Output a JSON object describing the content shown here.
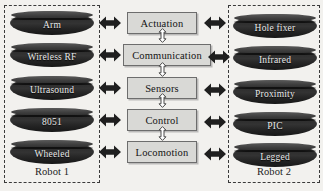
{
  "diagram": {
    "background_color": "#f2f1ee",
    "groups": [
      {
        "id": "robot1",
        "label": "Robot 1",
        "side": "left",
        "node_style": "dark-3d-cylinder",
        "node_fill": "#2b2b2b",
        "node_text_color": "#e9e9e9",
        "frame": "dashed",
        "nodes": [
          {
            "label": "Arm"
          },
          {
            "label": "Wireless RF"
          },
          {
            "label": "Ultrasound"
          },
          {
            "label": "8051"
          },
          {
            "label": "Wheeled"
          }
        ]
      },
      {
        "id": "robot2",
        "label": "Robot 2",
        "side": "right",
        "node_style": "dark-3d-cylinder",
        "node_fill": "#2b2b2b",
        "node_text_color": "#e9e9e9",
        "frame": "dashed",
        "nodes": [
          {
            "label": "Hole fixer"
          },
          {
            "label": "Infrared"
          },
          {
            "label": "Proximity"
          },
          {
            "label": "PIC"
          },
          {
            "label": "Legged"
          }
        ]
      }
    ],
    "center_column": {
      "block_fill": "#d9d9d6",
      "block_border": "#6d6d6d",
      "block_text_color": "#141414",
      "blocks": [
        {
          "label": "Actuation"
        },
        {
          "label": "Communication"
        },
        {
          "label": "Sensors"
        },
        {
          "label": "Control"
        },
        {
          "label": "Locomotion"
        }
      ]
    },
    "connectors": {
      "horizontal": {
        "style": "solid-double-headed-arrow",
        "color": "#1f1f1f",
        "count": 10,
        "note": "each Robot 1 node links to its center block; each center block links to its Robot 2 node"
      },
      "vertical": {
        "style": "outlined-double-headed-arrow",
        "fill": "#ffffff",
        "stroke": "#4a4a4a",
        "count": 4,
        "note": "Actuation–Communication–Sensors–Control–Locomotion chained vertically"
      }
    }
  }
}
